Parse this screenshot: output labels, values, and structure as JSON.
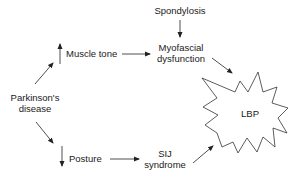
{
  "diagram": {
    "type": "flowchart",
    "nodes": {
      "spondylosis": "Spondylosis",
      "muscle_tone": "Muscle tone",
      "myofascial_line1": "Myofascial",
      "myofascial_line2": "dysfunction",
      "parkinsons_line1": "Parkinson's",
      "parkinsons_line2": "disease",
      "posture": "Posture",
      "sij_line1": "SIJ",
      "sij_line2": "syndrome",
      "lbp": "LBP"
    },
    "indicators": {
      "muscle_tone_direction": "increased",
      "posture_direction": "decreased"
    },
    "edges": [
      {
        "from": "Parkinson's disease",
        "to": "Muscle tone"
      },
      {
        "from": "Parkinson's disease",
        "to": "Posture"
      },
      {
        "from": "Muscle tone",
        "to": "Myofascial dysfunction"
      },
      {
        "from": "Spondylosis",
        "to": "Myofascial dysfunction"
      },
      {
        "from": "Myofascial dysfunction",
        "to": "LBP"
      },
      {
        "from": "Posture",
        "to": "SIJ syndrome"
      },
      {
        "from": "SIJ syndrome",
        "to": "LBP"
      }
    ],
    "colors": {
      "stroke": "#222222",
      "text": "#1a1a1a",
      "background": "#ffffff"
    }
  }
}
